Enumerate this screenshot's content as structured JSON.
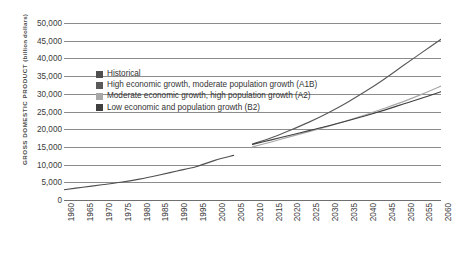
{
  "chart_data": {
    "type": "line",
    "title": "",
    "xlabel": "",
    "ylabel": "GROSS DOMESTIC PRODUCT",
    "ylabel_unit": "(billion dollars)",
    "ylim": [
      0,
      50000
    ],
    "xlim": [
      1960,
      2060
    ],
    "grid": true,
    "legend_position": "inside-upper-left",
    "y_ticks": [
      "50,000",
      "45,000",
      "40,000",
      "35,000",
      "30,000",
      "25,000",
      "20,000",
      "15,000",
      "10,000",
      "5,000",
      "0"
    ],
    "y_tick_values": [
      50000,
      45000,
      40000,
      35000,
      30000,
      25000,
      20000,
      15000,
      10000,
      5000,
      0
    ],
    "x_ticks": [
      "1960",
      "1965",
      "1970",
      "1975",
      "1980",
      "1985",
      "1990",
      "1995",
      "2000",
      "2005",
      "2010",
      "2015",
      "2020",
      "2025",
      "2030",
      "2035",
      "2040",
      "2045",
      "2050",
      "2055",
      "2060"
    ],
    "x_tick_values": [
      1960,
      1965,
      1970,
      1975,
      1980,
      1985,
      1990,
      1995,
      2000,
      2005,
      2010,
      2015,
      2020,
      2025,
      2030,
      2035,
      2040,
      2045,
      2050,
      2055,
      2060
    ],
    "series": [
      {
        "name": "Historical",
        "color": "#4f4f4f",
        "x": [
          1960,
          1965,
          1970,
          1975,
          1980,
          1985,
          1990,
          1995,
          2000,
          2005
        ],
        "values": [
          2900,
          3600,
          4300,
          5000,
          5900,
          7000,
          8200,
          9400,
          11200,
          12600
        ]
      },
      {
        "name": "High economic growth, moderate population growth (A1B)",
        "color": "#5a5a5a",
        "x": [
          2010,
          2015,
          2020,
          2025,
          2030,
          2035,
          2040,
          2045,
          2050,
          2055,
          2060
        ],
        "values": [
          15800,
          17600,
          19700,
          22000,
          24600,
          27500,
          30700,
          34200,
          38000,
          41700,
          45400
        ]
      },
      {
        "name": "Moderate economic growth, high population growth (A2)",
        "color": "#a8a8a8",
        "x": [
          2010,
          2015,
          2020,
          2025,
          2030,
          2035,
          2040,
          2045,
          2050,
          2055,
          2060
        ],
        "values": [
          15000,
          16400,
          17900,
          19300,
          20800,
          22400,
          24100,
          25900,
          27800,
          29900,
          32200
        ]
      },
      {
        "name": "Low economic and population growth (B2)",
        "color": "#3f3f3f",
        "x": [
          2010,
          2015,
          2020,
          2025,
          2030,
          2035,
          2040,
          2045,
          2050,
          2055,
          2060
        ],
        "values": [
          15700,
          17000,
          18300,
          19600,
          20900,
          22300,
          23800,
          25400,
          27100,
          28800,
          30600
        ]
      }
    ]
  },
  "legend": {
    "items": [
      {
        "label": "Historical",
        "color": "#4f4f4f"
      },
      {
        "label": "High economic growth, moderate population growth (A1B)",
        "color": "#5a5a5a"
      },
      {
        "label": "Moderate economic growth, high population growth (A2)",
        "color": "#a8a8a8"
      },
      {
        "label": "Low economic and population growth (B2)",
        "color": "#3f3f3f"
      }
    ]
  }
}
